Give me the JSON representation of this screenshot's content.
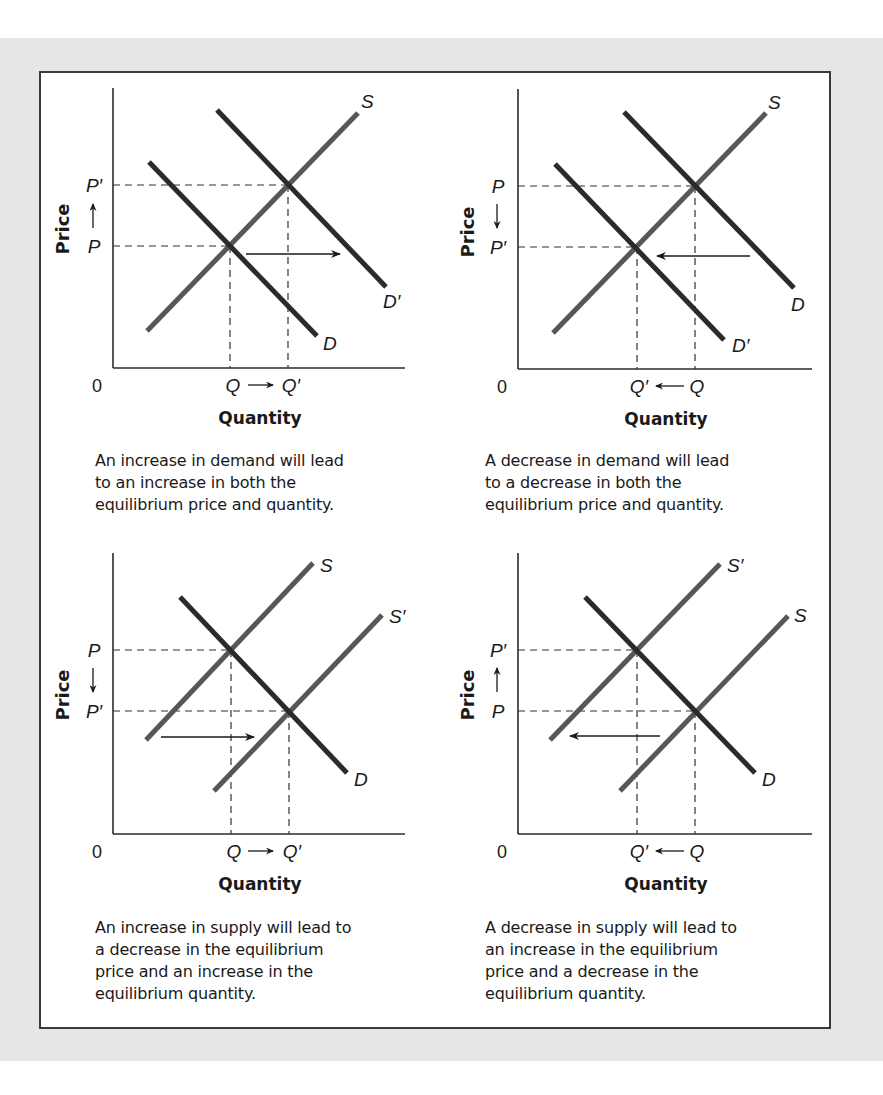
{
  "figure": {
    "panels": [
      {
        "id": "demand-increase",
        "y_axis_label": "Price",
        "x_axis_label": "Quantity",
        "origin_label": "0",
        "price_top_label": "P′",
        "price_bottom_label": "P",
        "price_arrow": "up",
        "qty_left_label": "Q",
        "qty_right_label": "Q′",
        "qty_arrow": "right",
        "curve_labels": {
          "supply": "S",
          "demand_original": "D",
          "demand_shifted": "D′"
        },
        "shift_arrow": "right",
        "caption": [
          "An increase in demand will lead",
          "to an increase in both the",
          "equilibrium price and quantity."
        ]
      },
      {
        "id": "demand-decrease",
        "y_axis_label": "Price",
        "x_axis_label": "Quantity",
        "origin_label": "0",
        "price_top_label": "P",
        "price_bottom_label": "P′",
        "price_arrow": "down",
        "qty_left_label": "Q′",
        "qty_right_label": "Q",
        "qty_arrow": "left",
        "curve_labels": {
          "supply": "S",
          "demand_original": "D",
          "demand_shifted": "D′"
        },
        "shift_arrow": "left",
        "caption": [
          "A decrease in demand will lead",
          "to a decrease in both the",
          "equilibrium price and quantity."
        ]
      },
      {
        "id": "supply-increase",
        "y_axis_label": "Price",
        "x_axis_label": "Quantity",
        "origin_label": "0",
        "price_top_label": "P",
        "price_bottom_label": "P′",
        "price_arrow": "down",
        "qty_left_label": "Q",
        "qty_right_label": "Q′",
        "qty_arrow": "right",
        "curve_labels": {
          "supply_original": "S",
          "supply_shifted": "S′",
          "demand": "D"
        },
        "shift_arrow": "right",
        "caption": [
          "An increase in supply will lead to",
          "a decrease in the equilibrium",
          "price and an increase in the",
          "equilibrium quantity."
        ]
      },
      {
        "id": "supply-decrease",
        "y_axis_label": "Price",
        "x_axis_label": "Quantity",
        "origin_label": "0",
        "price_top_label": "P′",
        "price_bottom_label": "P",
        "price_arrow": "up",
        "qty_left_label": "Q′",
        "qty_right_label": "Q",
        "qty_arrow": "left",
        "curve_labels": {
          "supply_original": "S",
          "supply_shifted": "S′",
          "demand": "D"
        },
        "shift_arrow": "left",
        "caption": [
          "A decrease in supply will lead to",
          "an increase in the equilibrium",
          "price and a decrease in the",
          "equilibrium quantity."
        ]
      }
    ],
    "colors": {
      "background_band": "#e6e6e6",
      "frame_border": "#3a3a3a",
      "supply_line": "#575757",
      "demand_line": "#2b2b2b",
      "axis": "#2b2b2b",
      "text": "#1a1a1a"
    }
  }
}
